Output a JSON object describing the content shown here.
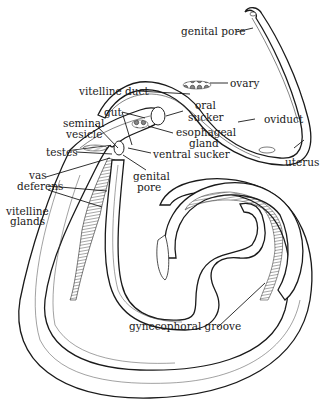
{
  "diagram": {
    "labels": {
      "genital_pore_top": "genital pore",
      "ovary": "ovary",
      "vitelline_duct": "vitelline duct",
      "gut": "gut",
      "oral_sucker_1": "oral",
      "oral_sucker_2": "sucker",
      "oviduct": "oviduct",
      "seminal_vesicle_1": "seminal",
      "seminal_vesicle_2": "vesicle",
      "esophageal_gland_1": "esophageal",
      "esophageal_gland_2": "gland",
      "testes": "testes",
      "ventral_sucker": "ventral sucker",
      "uterus": "uterus",
      "vas_deferens_1": "vas",
      "vas_deferens_2": "deferens",
      "genital_pore_mid_1": "genital",
      "genital_pore_mid_2": "pore",
      "vitelline_glands_1": "vitelline",
      "vitelline_glands_2": "glands",
      "gynecophoral_groove": "gynecophoral groove"
    },
    "colors": {
      "ink": "#1a1a1a",
      "paper": "#ffffff"
    }
  }
}
